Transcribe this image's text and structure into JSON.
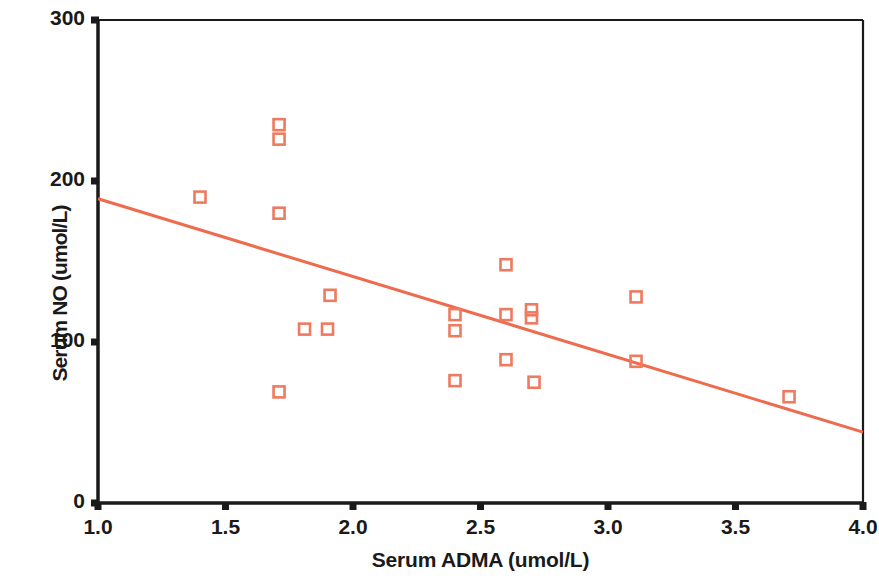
{
  "chart_data": {
    "type": "scatter",
    "title": "",
    "xlabel": "Serum ADMA (umol/L)",
    "ylabel": "Serum NO (umol/L)",
    "xlim": [
      1.0,
      4.0
    ],
    "ylim": [
      0,
      300
    ],
    "xticks": [
      "1.0",
      "1.5",
      "2.0",
      "2.5",
      "3.0",
      "3.5",
      "4.0"
    ],
    "xtick_values": [
      1.0,
      1.5,
      2.0,
      2.5,
      3.0,
      3.5,
      4.0
    ],
    "yticks": [
      "0",
      "100",
      "200",
      "300"
    ],
    "ytick_values": [
      0,
      100,
      200,
      300
    ],
    "grid": false,
    "legend": null,
    "marker": "open-square",
    "marker_color": "#ee7a5f",
    "line_color": "#ee6b4e",
    "axis_color": "#1a1a1a",
    "series": [
      {
        "name": "Patients",
        "points": [
          {
            "x": 1.4,
            "y": 190
          },
          {
            "x": 1.71,
            "y": 235
          },
          {
            "x": 1.71,
            "y": 226
          },
          {
            "x": 1.71,
            "y": 180
          },
          {
            "x": 1.71,
            "y": 69
          },
          {
            "x": 1.81,
            "y": 108
          },
          {
            "x": 1.9,
            "y": 108
          },
          {
            "x": 1.91,
            "y": 129
          },
          {
            "x": 2.4,
            "y": 117
          },
          {
            "x": 2.4,
            "y": 107
          },
          {
            "x": 2.4,
            "y": 76
          },
          {
            "x": 2.6,
            "y": 148
          },
          {
            "x": 2.6,
            "y": 117
          },
          {
            "x": 2.6,
            "y": 89
          },
          {
            "x": 2.7,
            "y": 120
          },
          {
            "x": 2.7,
            "y": 115
          },
          {
            "x": 2.71,
            "y": 75
          },
          {
            "x": 3.11,
            "y": 128
          },
          {
            "x": 3.11,
            "y": 88
          },
          {
            "x": 3.71,
            "y": 66
          }
        ]
      }
    ],
    "trendline": {
      "name": "linear fit",
      "x_start": 1.0,
      "y_start": 189,
      "x_end": 4.0,
      "y_end": 44
    }
  }
}
